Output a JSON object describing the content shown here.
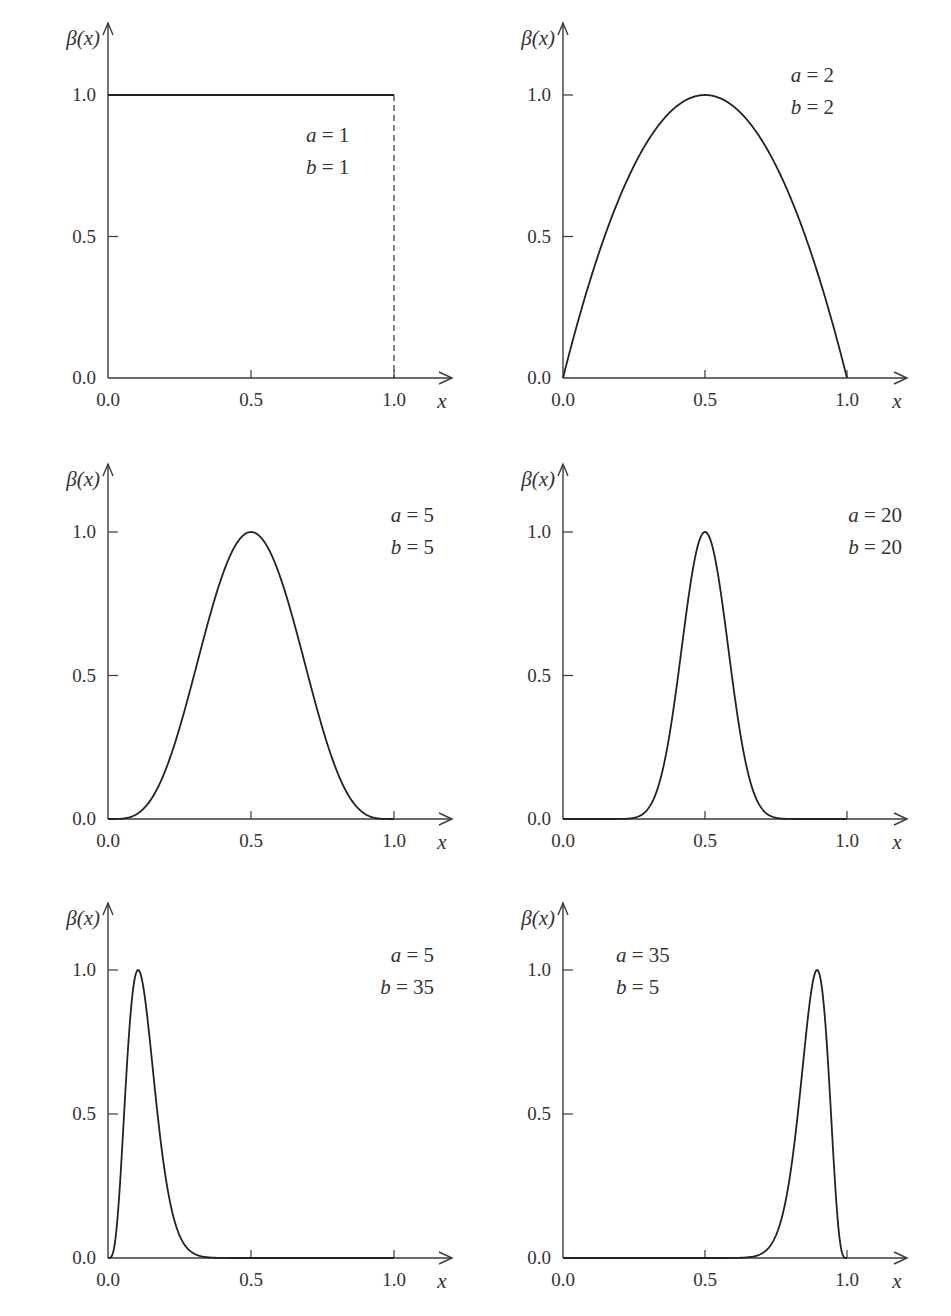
{
  "figure": {
    "y_axis_label": "β(x)",
    "x_axis_label": "x",
    "x_tick_labels": [
      "0.0",
      "0.5",
      "1.0"
    ],
    "y_tick_labels": [
      "0.0",
      "0.5",
      "1.0"
    ]
  },
  "chart_data": [
    {
      "type": "line",
      "title": "",
      "params": {
        "a": 1,
        "b": 1
      },
      "legend": [
        "a = 1",
        "b = 1"
      ],
      "xlabel": "x",
      "ylabel": "β(x)",
      "xlim": [
        0,
        1.0
      ],
      "ylim": [
        0,
        1.0
      ],
      "x_ticks": [
        0.0,
        0.5,
        1.0
      ],
      "y_ticks": [
        0.0,
        0.5,
        1.0
      ],
      "grid": false,
      "annotations": [
        "dashed vertical line at x = 1.0 from 0 to 1.0"
      ],
      "description": "Uniform density normalized to peak 1.0: constant 1.0 on [0,1]",
      "x": [
        0.0,
        0.25,
        0.5,
        0.75,
        1.0
      ],
      "y": [
        1.0,
        1.0,
        1.0,
        1.0,
        1.0
      ]
    },
    {
      "type": "line",
      "title": "",
      "params": {
        "a": 2,
        "b": 2
      },
      "legend": [
        "a = 2",
        "b = 2"
      ],
      "xlabel": "x",
      "ylabel": "β(x)",
      "xlim": [
        0,
        1.0
      ],
      "ylim": [
        0,
        1.0
      ],
      "x_ticks": [
        0.0,
        0.5,
        1.0
      ],
      "y_ticks": [
        0.0,
        0.5,
        1.0
      ],
      "grid": false,
      "description": "Beta(2,2) scaled to peak 1.0 at x=0.5",
      "x": [
        0.0,
        0.1,
        0.2,
        0.3,
        0.4,
        0.5,
        0.6,
        0.7,
        0.8,
        0.9,
        1.0
      ],
      "y": [
        0.0,
        0.36,
        0.64,
        0.84,
        0.96,
        1.0,
        0.96,
        0.84,
        0.64,
        0.36,
        0.0
      ]
    },
    {
      "type": "line",
      "title": "",
      "params": {
        "a": 5,
        "b": 5
      },
      "legend": [
        "a = 5",
        "b = 5"
      ],
      "xlabel": "x",
      "ylabel": "β(x)",
      "xlim": [
        0,
        1.0
      ],
      "ylim": [
        0,
        1.0
      ],
      "x_ticks": [
        0.0,
        0.5,
        1.0
      ],
      "y_ticks": [
        0.0,
        0.5,
        1.0
      ],
      "grid": false,
      "description": "Beta(5,5) scaled to peak 1.0 at x=0.5",
      "x": [
        0.0,
        0.1,
        0.2,
        0.3,
        0.4,
        0.5,
        0.6,
        0.7,
        0.8,
        0.9,
        1.0
      ],
      "y": [
        0.0,
        0.017,
        0.17,
        0.5,
        0.85,
        1.0,
        0.85,
        0.5,
        0.17,
        0.017,
        0.0
      ]
    },
    {
      "type": "line",
      "title": "",
      "params": {
        "a": 20,
        "b": 20
      },
      "legend": [
        "a = 20",
        "b = 20"
      ],
      "xlabel": "x",
      "ylabel": "β(x)",
      "xlim": [
        0,
        1.0
      ],
      "ylim": [
        0,
        1.0
      ],
      "x_ticks": [
        0.0,
        0.5,
        1.0
      ],
      "y_ticks": [
        0.0,
        0.5,
        1.0
      ],
      "grid": false,
      "description": "Beta(20,20) scaled to peak 1.0 at x=0.5",
      "x": [
        0.0,
        0.2,
        0.3,
        0.35,
        0.4,
        0.45,
        0.5,
        0.55,
        0.6,
        0.65,
        0.7,
        0.8,
        1.0
      ],
      "y": [
        0.0,
        0.0,
        0.05,
        0.18,
        0.46,
        0.82,
        1.0,
        0.82,
        0.46,
        0.18,
        0.05,
        0.0,
        0.0
      ]
    },
    {
      "type": "line",
      "title": "",
      "params": {
        "a": 5,
        "b": 35
      },
      "legend": [
        "a = 5",
        "b = 35"
      ],
      "xlabel": "x",
      "ylabel": "β(x)",
      "xlim": [
        0,
        1.0
      ],
      "ylim": [
        0,
        1.0
      ],
      "x_ticks": [
        0.0,
        0.5,
        1.0
      ],
      "y_ticks": [
        0.0,
        0.5,
        1.0
      ],
      "grid": false,
      "description": "Beta(5,35) scaled to peak 1.0 near x≈0.1",
      "x": [
        0.0,
        0.05,
        0.1,
        0.15,
        0.2,
        0.25,
        0.3,
        0.4,
        0.5,
        1.0
      ],
      "y": [
        0.0,
        0.55,
        1.0,
        0.66,
        0.24,
        0.06,
        0.01,
        0.0,
        0.0,
        0.0
      ]
    },
    {
      "type": "line",
      "title": "",
      "params": {
        "a": 35,
        "b": 5
      },
      "legend": [
        "a = 35",
        "b = 5"
      ],
      "xlabel": "x",
      "ylabel": "β(x)",
      "xlim": [
        0,
        1.0
      ],
      "ylim": [
        0,
        1.0
      ],
      "x_ticks": [
        0.0,
        0.5,
        1.0
      ],
      "y_ticks": [
        0.0,
        0.5,
        1.0
      ],
      "grid": false,
      "description": "Beta(35,5) scaled to peak 1.0 near x≈0.9",
      "x": [
        0.4,
        0.5,
        0.6,
        0.7,
        0.75,
        0.8,
        0.85,
        0.9,
        0.95,
        1.0
      ],
      "y": [
        0.0,
        0.0,
        0.0,
        0.06,
        0.24,
        0.66,
        0.98,
        1.0,
        0.55,
        0.0
      ]
    }
  ],
  "panels": [
    {
      "a_label": "a = 1",
      "b_label": "b = 1",
      "a_val": "1",
      "b_val": "1"
    },
    {
      "a_label": "a = 2",
      "b_label": "b = 2",
      "a_val": "2",
      "b_val": "2"
    },
    {
      "a_label": "a = 5",
      "b_label": "b = 5",
      "a_val": "5",
      "b_val": "5"
    },
    {
      "a_label": "a = 20",
      "b_label": "b = 20",
      "a_val": "20",
      "b_val": "20"
    },
    {
      "a_label": "a = 5",
      "b_label": "b = 35",
      "a_val": "5",
      "b_val": "35"
    },
    {
      "a_label": "a = 35",
      "b_label": "b = 5",
      "a_val": "35",
      "b_val": "5"
    }
  ],
  "colors": {
    "axis": "#3a3a3a",
    "curve": "#222222",
    "text": "#333333",
    "background": "#ffffff"
  }
}
